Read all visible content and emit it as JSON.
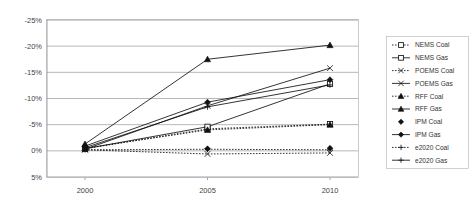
{
  "chart_data": {
    "type": "line",
    "title": "",
    "xlabel": "",
    "ylabel": "",
    "x": [
      2000,
      2005,
      2010
    ],
    "xtick_labels": [
      "2000",
      "2005",
      "2010"
    ],
    "ytick_labels": [
      "-25%",
      "-20%",
      "-15%",
      "-10%",
      "-5%",
      "0%",
      "5%"
    ],
    "ytick_values": [
      -25,
      -20,
      -15,
      -10,
      -5,
      0,
      5
    ],
    "ylim": [
      -25,
      5
    ],
    "y_axis_inverted": true,
    "grid": true,
    "legend_position": "right",
    "series": [
      {
        "name": "NEMS Coal",
        "label": "NEMS Coal",
        "marker": "open-square",
        "line": "dotted",
        "values": [
          -0.4,
          -4.2,
          -5.1
        ]
      },
      {
        "name": "NEMS Gas",
        "label": "NEMS Gas",
        "marker": "open-square",
        "line": "solid",
        "values": [
          -0.4,
          -4.6,
          -12.8
        ]
      },
      {
        "name": "POEMS Coal",
        "label": "POEMS Coal",
        "marker": "x",
        "line": "dotted",
        "values": [
          -0.2,
          0.6,
          0.4
        ]
      },
      {
        "name": "POEMS Gas",
        "label": "POEMS Gas",
        "marker": "x",
        "line": "solid",
        "values": [
          -0.3,
          -8.6,
          -15.8
        ]
      },
      {
        "name": "RFF Coal",
        "label": "RFF Coal",
        "marker": "triangle",
        "line": "dotted",
        "values": [
          -0.5,
          -4.0,
          -5.0
        ]
      },
      {
        "name": "RFF Gas",
        "label": "RFF Gas",
        "marker": "triangle",
        "line": "solid",
        "values": [
          -1.3,
          -17.5,
          -20.2
        ]
      },
      {
        "name": "IPM Coal",
        "label": "IPM Coal",
        "marker": "diamond",
        "line": "none",
        "values": [
          -0.9,
          -0.4,
          -0.5
        ]
      },
      {
        "name": "IPM Gas",
        "label": "IPM Gas",
        "marker": "diamond",
        "line": "solid",
        "values": [
          -0.9,
          -9.3,
          -13.6
        ]
      },
      {
        "name": "e2020 Coal",
        "label": "e2020 Coal",
        "marker": "plus",
        "line": "dotted",
        "values": [
          -0.2,
          -0.3,
          -0.2
        ]
      },
      {
        "name": "e2020 Gas",
        "label": "e2020 Gas",
        "marker": "plus",
        "line": "solid",
        "values": [
          -0.6,
          -8.4,
          -12.6
        ]
      }
    ]
  }
}
